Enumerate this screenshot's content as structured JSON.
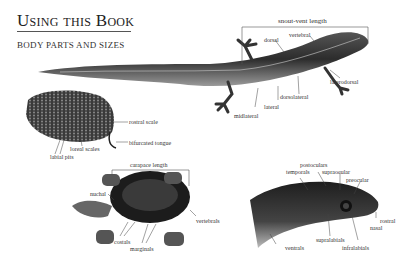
{
  "page": {
    "title": "Using this Book",
    "subtitle": "BODY PARTS AND SIZES"
  },
  "lizard": {
    "measure_label": "snout-vent length",
    "labels": {
      "dorsal": "dorsal",
      "vertebral": "vertebral",
      "laterodorsal": "laterodorsal",
      "dorsolateral": "dorsolateral",
      "lateral": "lateral",
      "midlateral": "midlateral"
    }
  },
  "snake_head_top": {
    "labels": {
      "rostral_scale": "rostral scale",
      "bifurcated_tongue": "bifurcated tongue",
      "loreal_scales": "loreal scales",
      "labial_pits": "labial pits"
    }
  },
  "turtle": {
    "measure_label": "carapace length",
    "labels": {
      "nuchal": "nuchal",
      "vertebrals": "vertebrals",
      "costals": "costals",
      "marginals": "marginals"
    }
  },
  "snake_head_side": {
    "labels": {
      "postoculars": "postoculars",
      "temporals": "temporals",
      "supraocular": "supraocular",
      "preocular": "preocular",
      "rostral": "rostral",
      "nasal": "nasal",
      "supralabials": "supralabials",
      "infralabials": "infralabials",
      "ventrals": "ventrals"
    }
  }
}
